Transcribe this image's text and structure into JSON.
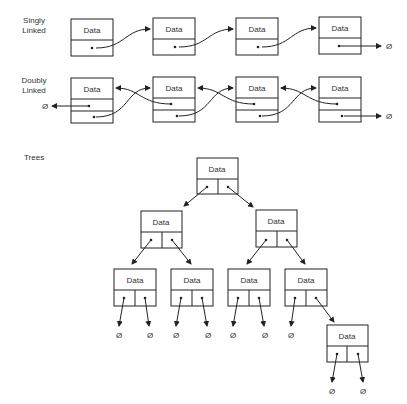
{
  "sections": {
    "singly": {
      "title_line1": "Singly",
      "title_line2": "Linked"
    },
    "doubly": {
      "title_line1": "Doubly",
      "title_line2": "Linked"
    },
    "trees": {
      "title": "Trees"
    }
  },
  "node_label": "Data",
  "null_symbol": "Ø",
  "singly_nodes": [
    {
      "label": "Data"
    },
    {
      "label": "Data"
    },
    {
      "label": "Data"
    },
    {
      "label": "Data"
    }
  ],
  "doubly_nodes": [
    {
      "label": "Data"
    },
    {
      "label": "Data"
    },
    {
      "label": "Data"
    },
    {
      "label": "Data"
    }
  ],
  "tree_nodes": [
    {
      "id": "root",
      "label": "Data"
    },
    {
      "id": "l",
      "label": "Data"
    },
    {
      "id": "r",
      "label": "Data"
    },
    {
      "id": "ll",
      "label": "Data"
    },
    {
      "id": "lr",
      "label": "Data"
    },
    {
      "id": "rl",
      "label": "Data"
    },
    {
      "id": "rr",
      "label": "Data"
    },
    {
      "id": "rrr",
      "label": "Data"
    }
  ],
  "colors": {
    "stroke": "#222222",
    "text": "#333333",
    "background": "#ffffff"
  }
}
